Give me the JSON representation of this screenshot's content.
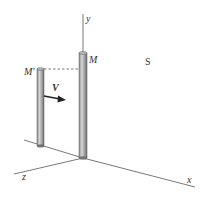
{
  "diagram": {
    "labels": {
      "y_axis": "y",
      "x_axis": "x",
      "z_axis": "z",
      "rod_moving": "M'",
      "rod_fixed": "M",
      "velocity": "V",
      "frame": "S"
    },
    "colors": {
      "axis": "#555555",
      "rod_light": "#c8c8c8",
      "rod_dark": "#7a7a7a",
      "arrow": "#222222",
      "text": "#333333"
    }
  }
}
